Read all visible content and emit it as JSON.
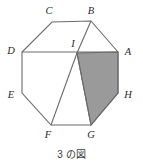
{
  "figure": {
    "caption": "3 の図",
    "colors": {
      "stroke": "#6b6b6b",
      "shade_fill": "#9a9a9a",
      "shade_stroke": "#6b6b6b",
      "background": "#ffffff",
      "label_color": "#2b2b2b"
    },
    "vertices": [
      {
        "id": "A",
        "label": "A",
        "x": 118,
        "y": 52,
        "label_x": 128,
        "label_y": 52
      },
      {
        "id": "B",
        "label": "B",
        "x": 91,
        "y": 21,
        "label_x": 91,
        "label_y": 11
      },
      {
        "id": "C",
        "label": "C",
        "x": 52,
        "y": 22,
        "label_x": 49,
        "label_y": 11
      },
      {
        "id": "D",
        "label": "D",
        "x": 22,
        "y": 52,
        "label_x": 11,
        "label_y": 51
      },
      {
        "id": "E",
        "label": "E",
        "x": 22,
        "y": 93,
        "label_x": 11,
        "label_y": 95
      },
      {
        "id": "F",
        "label": "F",
        "x": 51,
        "y": 125,
        "label_x": 48,
        "label_y": 135
      },
      {
        "id": "G",
        "label": "G",
        "x": 91,
        "y": 125,
        "label_x": 91,
        "label_y": 135
      },
      {
        "id": "H",
        "label": "H",
        "x": 118,
        "y": 93,
        "label_x": 128,
        "label_y": 95
      },
      {
        "id": "I",
        "label": "I",
        "x": 77,
        "y": 53,
        "label_x": 73,
        "label_y": 44
      }
    ],
    "octagon_path": "M118,52 L91,21 L52,22 L22,52 L22,93 L51,125 L91,125 L118,93 Z",
    "shaded_region": {
      "name": "quadrilateral-IAHG",
      "path": "M77,53 L118,52 L118,93 L91,125 Z"
    },
    "inner_segments": [
      {
        "name": "segment-BI",
        "x1": 91,
        "y1": 21,
        "x2": 77,
        "y2": 53
      },
      {
        "name": "segment-IF",
        "x1": 77,
        "y1": 53,
        "x2": 51,
        "y2": 125
      },
      {
        "name": "segment-IG",
        "x1": 77,
        "y1": 53,
        "x2": 91,
        "y2": 125
      },
      {
        "name": "segment-DA",
        "x1": 22,
        "y1": 52,
        "x2": 118,
        "y2": 52
      }
    ]
  }
}
